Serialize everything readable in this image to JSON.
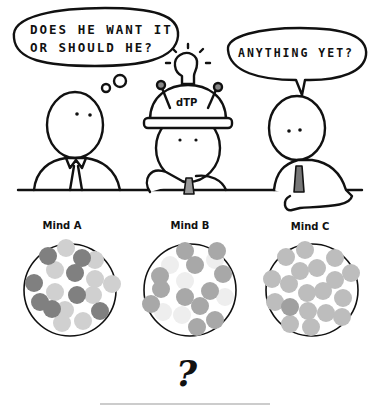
{
  "speech": {
    "left_thought": [
      "DOES HE WANT IT",
      "OR SHOULD HE?"
    ],
    "right_speech": "ANYTHING YET?"
  },
  "helmet": {
    "label": "dTP"
  },
  "minds": [
    {
      "label": "Mind A",
      "dark_color": "#808080",
      "light_color": "#d0d0d0"
    },
    {
      "label": "Mind B",
      "dark_color": "#a8a8a8",
      "light_color": "#eeeeee"
    },
    {
      "label": "Mind C",
      "dark_color": "#a0a0a0",
      "light_color": "#bdbdbd"
    }
  ],
  "footer": {
    "question": "?"
  }
}
